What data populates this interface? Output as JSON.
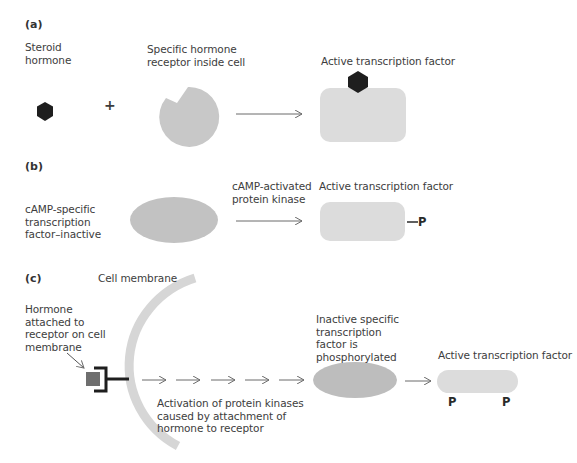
{
  "panels": {
    "a": {
      "label": "(a)",
      "steroid_label": "Steroid\nhormone",
      "plus": "+",
      "receptor_label": "Specific hormone\nreceptor inside cell",
      "result_label": "Active transcription factor"
    },
    "b": {
      "label": "(b)",
      "inactive_label": "cAMP-specific\ntranscription\nfactor–inactive",
      "kinase_label": "cAMP-activated\nprotein kinase",
      "result_label": "Active transcription factor",
      "phosphate": "P"
    },
    "c": {
      "label": "(c)",
      "membrane_label": "Cell membrane",
      "hormone_label": "Hormone\nattached to\nreceptor on cell\nmembrane",
      "cascade_label": "Activation of protein kinases\ncaused by attachment of\nhormone to receptor",
      "inactive_label": "Inactive specific\ntranscription\nfactor is\nphosphorylated",
      "result_label": "Active transcription factor",
      "phosphate_left": "P",
      "phosphate_right": "P"
    }
  },
  "colors": {
    "hormone": "#1e1e1e",
    "receptor": "#c8c8c8",
    "active_factor": "#dcdcdc",
    "inactive_factor": "#bdbdbd",
    "membrane": "#d6d6d6",
    "membrane_hormone": "#6e6e6e",
    "arrow": "#6a6a6a"
  }
}
